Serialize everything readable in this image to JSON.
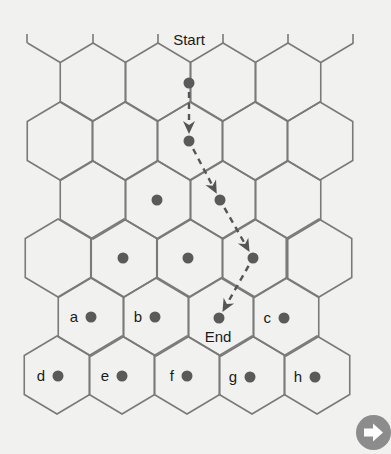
{
  "diagram": {
    "start_label": "Start",
    "end_label": "End",
    "grid": {
      "col_spacing": 65.5,
      "side": 39,
      "rows": [
        {
          "row": 1,
          "cy": 82,
          "cx": [
            93,
            158,
            223,
            288
          ]
        },
        {
          "row": 2,
          "cy": 141,
          "cx": [
            60,
            125,
            190,
            255,
            320
          ]
        },
        {
          "row": 3,
          "cy": 200,
          "cx": [
            93,
            158,
            223,
            288
          ]
        },
        {
          "row": 4,
          "cy": 258,
          "cx": [
            58,
            124,
            190,
            255,
            319
          ]
        },
        {
          "row": 5,
          "cy": 317,
          "cx": [
            91,
            156,
            221,
            286
          ]
        },
        {
          "row": 6,
          "cy": 375,
          "cx": [
            57,
            122,
            187,
            252,
            317
          ]
        }
      ],
      "top_stubs_x": [
        27,
        93,
        158,
        223,
        288,
        353
      ]
    },
    "path_points": [
      {
        "x": 189,
        "y": 83
      },
      {
        "x": 189,
        "y": 141
      },
      {
        "x": 220,
        "y": 200
      },
      {
        "x": 253,
        "y": 258
      },
      {
        "x": 219,
        "y": 318
      }
    ],
    "extra_dots": [
      {
        "x": 157,
        "y": 200
      },
      {
        "x": 123,
        "y": 258
      },
      {
        "x": 188,
        "y": 258
      }
    ],
    "labeled_cells": [
      {
        "label": "a",
        "dot_x": 91,
        "dot_y": 317
      },
      {
        "label": "b",
        "dot_x": 155,
        "dot_y": 317
      },
      {
        "label": "c",
        "dot_x": 284,
        "dot_y": 318
      },
      {
        "label": "d",
        "dot_x": 58,
        "dot_y": 376
      },
      {
        "label": "e",
        "dot_x": 122,
        "dot_y": 376
      },
      {
        "label": "f",
        "dot_x": 187,
        "dot_y": 376
      },
      {
        "label": "g",
        "dot_x": 250,
        "dot_y": 377
      },
      {
        "label": "h",
        "dot_x": 315,
        "dot_y": 377
      }
    ],
    "colors": {
      "background": "#f1f1f0",
      "grid_line": "#7a7a7a",
      "dot": "#5a5a5a",
      "path": "#555555",
      "next_button": "#8c8c8c"
    }
  },
  "navigation": {
    "next_button_icon": "right-arrow-icon"
  }
}
